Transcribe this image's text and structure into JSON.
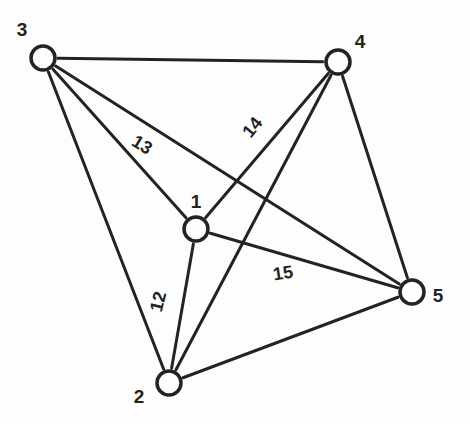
{
  "figure": {
    "name": "undirected-graph-k5",
    "background_color": "#fdfdfd",
    "ink_color": "#232323",
    "width": 470,
    "height": 424
  },
  "graph_data": {
    "type": "node-link-diagram",
    "graph_kind": "complete-graph",
    "node_count": 5,
    "edge_count": 10,
    "nodes": [
      {
        "id": "1",
        "label": "1",
        "cx": 196,
        "cy": 229,
        "r": 12,
        "label_x": 196,
        "label_y": 208
      },
      {
        "id": "2",
        "label": "2",
        "cx": 169,
        "cy": 383,
        "r": 12,
        "label_x": 139,
        "label_y": 403
      },
      {
        "id": "3",
        "label": "3",
        "cx": 43,
        "cy": 58,
        "r": 12,
        "label_x": 22,
        "label_y": 36
      },
      {
        "id": "4",
        "label": "4",
        "cx": 338,
        "cy": 62,
        "r": 12,
        "label_x": 360,
        "label_y": 48
      },
      {
        "id": "5",
        "label": "5",
        "cx": 412,
        "cy": 292,
        "r": 12,
        "label_x": 438,
        "label_y": 302
      }
    ],
    "edges": [
      {
        "source": "3",
        "target": "4",
        "label": ""
      },
      {
        "source": "3",
        "target": "1",
        "label": "13",
        "label_x": 139,
        "label_y": 150,
        "label_rotation": 31
      },
      {
        "source": "3",
        "target": "2",
        "label": ""
      },
      {
        "source": "3",
        "target": "5",
        "label": ""
      },
      {
        "source": "4",
        "target": "1",
        "label": "14",
        "label_x": 257,
        "label_y": 131,
        "label_rotation": -51
      },
      {
        "source": "4",
        "target": "2",
        "label": ""
      },
      {
        "source": "4",
        "target": "5",
        "label": ""
      },
      {
        "source": "1",
        "target": "2",
        "label": "12",
        "label_x": 164,
        "label_y": 303,
        "label_rotation": -76
      },
      {
        "source": "1",
        "target": "5",
        "label": "15",
        "label_x": 284,
        "label_y": 279,
        "label_rotation": -9
      },
      {
        "source": "2",
        "target": "5",
        "label": ""
      }
    ],
    "edge_labels": [
      "12",
      "13",
      "14",
      "15"
    ],
    "node_labels": [
      "1",
      "2",
      "3",
      "4",
      "5"
    ],
    "style": {
      "edge_stroke_width": 3,
      "node_stroke_width": 3.5,
      "node_radius": 12
    }
  }
}
